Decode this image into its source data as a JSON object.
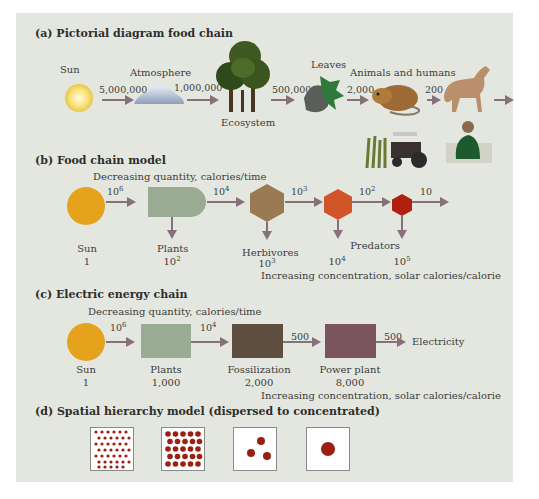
{
  "colors": {
    "panel_bg": "#e4e7df",
    "arrow": "#86707a",
    "sun": "#e5a21c",
    "plants": "#9aab94",
    "herbivores": "#9a7a52",
    "predators1": "#d2552a",
    "predators2": "#b0200f",
    "fossilization": "#5e4e40",
    "power_plant": "#7a5560",
    "dots": "#9c1f12"
  },
  "section_a": {
    "title": "(a) Pictorial diagram food chain",
    "nodes": [
      {
        "label": "Sun",
        "icon": "sun-icon"
      },
      {
        "label": "Atmosphere",
        "icon": "cloud-icon"
      },
      {
        "label": "Ecosystem",
        "icon": "trees-icon"
      },
      {
        "label": "Leaves",
        "icon": "leaves-icon"
      },
      {
        "label": "Animals and humans",
        "icon": "mouse-icon"
      },
      {
        "label": "",
        "icon": "wolf-icon"
      }
    ],
    "flows": [
      "5,000,000",
      "1,000,000",
      "500,000",
      "2,000",
      "200"
    ],
    "extra_icons": [
      "tractor-icon",
      "corn-icon",
      "person-icon"
    ]
  },
  "section_b": {
    "title": "(b) Food chain model",
    "top_caption": "Decreasing quantity, calories/time",
    "bottom_caption": "Increasing concentration, solar calories/calorie",
    "nodes": [
      {
        "label": "Sun",
        "value": "1",
        "shape": "circle"
      },
      {
        "label": "Plants",
        "value_base": "10",
        "value_exp": "2",
        "shape": "tank"
      },
      {
        "label": "Herbivores",
        "value_base": "10",
        "value_exp": "3",
        "shape": "hexagon"
      },
      {
        "label": "",
        "value_base": "10",
        "value_exp": "4",
        "shape": "hexagon"
      },
      {
        "label": "",
        "value_base": "10",
        "value_exp": "5",
        "shape": "hexagon"
      }
    ],
    "predators_label": "Predators",
    "flows": [
      {
        "base": "10",
        "exp": "6"
      },
      {
        "base": "10",
        "exp": "4"
      },
      {
        "base": "10",
        "exp": "3"
      },
      {
        "base": "10",
        "exp": "2"
      },
      {
        "base": "10",
        "exp": ""
      }
    ]
  },
  "section_c": {
    "title": "(c) Electric energy chain",
    "top_caption": "Decreasing quantity, calories/time",
    "bottom_caption": "Increasing concentration, solar calories/calorie",
    "nodes": [
      {
        "label": "Sun",
        "value": "1"
      },
      {
        "label": "Plants",
        "value": "1,000"
      },
      {
        "label": "Fossilization",
        "value": "2,000"
      },
      {
        "label": "Power plant",
        "value": "8,000"
      }
    ],
    "flows": [
      {
        "base": "10",
        "exp": "6"
      },
      {
        "base": "10",
        "exp": "4"
      },
      {
        "base": "500",
        "exp": ""
      },
      {
        "base": "500",
        "exp": ""
      }
    ],
    "output_label": "Electricity"
  },
  "section_d": {
    "title": "(d) Spatial hierarchy model (dispersed to concentrated)",
    "boxes": [
      "many small dots",
      "fewer medium dots",
      "three dots",
      "one large dot"
    ]
  }
}
